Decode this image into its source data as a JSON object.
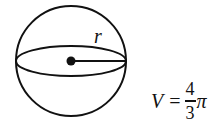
{
  "diagram": {
    "shape": "sphere",
    "radius_label": "r",
    "stroke_color": "#111111",
    "background": "#ffffff"
  },
  "formula": {
    "lhs": "V",
    "equals": "=",
    "fraction_numerator": "4",
    "fraction_denominator": "3",
    "truncated_tail": "π",
    "note_visible": "V = 4/3 π… (cut off at right edge)"
  }
}
